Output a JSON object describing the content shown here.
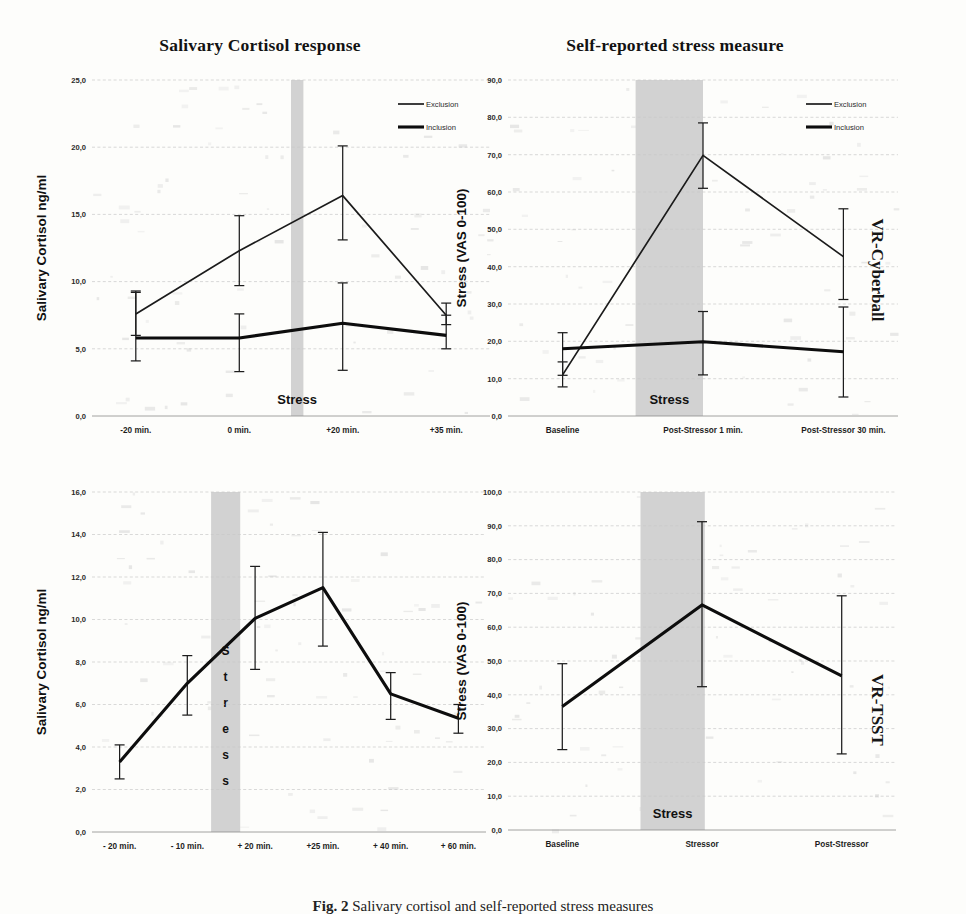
{
  "figure": {
    "caption_label": "Fig. 2",
    "caption_text": "Salivary cortisol and self-reported stress measures",
    "column_titles": [
      "Salivary  Cortisol response",
      "Self-reported stress measure"
    ],
    "row_labels": [
      "VR-Cyberball",
      "VR-TSST"
    ],
    "legend": [
      {
        "label": "Exclusion",
        "style": "thin"
      },
      {
        "label": "Inclusion",
        "style": "thick"
      }
    ],
    "band_label": "Stress",
    "colors": {
      "line": "#1b1b1b",
      "band": "#d2d2d2",
      "grid": "#c9c9c9",
      "text": "#1a1a1a"
    }
  },
  "chart_data": [
    {
      "id": "cyberball-cortisol",
      "type": "line",
      "title": "Salivary  Cortisol response",
      "row": "VR-Cyberball",
      "xlabel": "",
      "ylabel": "Salivary Cortisol ng/ml",
      "categories": [
        "-20 min.",
        "0 min.",
        "+20 min.",
        "+35 min."
      ],
      "ylim": [
        0,
        25
      ],
      "yticks": [
        "0,0",
        "5,0",
        "10,0",
        "15,0",
        "20,0",
        "25,0"
      ],
      "ytick_values": [
        0,
        5,
        10,
        15,
        20,
        25
      ],
      "grid": true,
      "legend_position": "top-right",
      "band": {
        "label": "Stress",
        "from_index": 1,
        "to_index": 2,
        "start_frac": 0.5,
        "end_frac": 0.62
      },
      "series": [
        {
          "name": "Exclusion",
          "style": "thin",
          "values": [
            7.6,
            12.3,
            16.4,
            7.5
          ],
          "err_low": [
            6.0,
            9.7,
            13.1,
            6.8
          ],
          "err_high": [
            9.3,
            14.9,
            20.1,
            8.4
          ]
        },
        {
          "name": "Inclusion",
          "style": "thick",
          "values": [
            5.8,
            5.8,
            6.9,
            6.0
          ],
          "err_low": [
            4.1,
            3.3,
            3.4,
            5.0
          ],
          "err_high": [
            9.2,
            7.6,
            9.9,
            7.5
          ]
        }
      ]
    },
    {
      "id": "cyberball-stress",
      "type": "line",
      "title": "Self-reported stress measure",
      "row": "VR-Cyberball",
      "xlabel": "",
      "ylabel": "Stress (VAS 0-100)",
      "categories": [
        "Baseline",
        "Post-Stressor 1 min.",
        "Post-Stressor 30 min."
      ],
      "ylim": [
        0,
        90
      ],
      "yticks": [
        "0,0",
        "10,0",
        "20,0",
        "30,0",
        "40,0",
        "50,0",
        "60,0",
        "70,0",
        "80,0",
        "90,0"
      ],
      "ytick_values": [
        0,
        10,
        20,
        30,
        40,
        50,
        60,
        70,
        80,
        90
      ],
      "grid": true,
      "legend_position": "top-right",
      "band": {
        "label": "Stress",
        "from_index": 0,
        "to_index": 1,
        "start_frac": 0.52,
        "end_frac": 1.0
      },
      "series": [
        {
          "name": "Exclusion",
          "style": "thin",
          "values": [
            11.0,
            69.8,
            42.7
          ],
          "err_low": [
            7.8,
            61.0,
            31.2
          ],
          "err_high": [
            14.5,
            78.5,
            55.5
          ]
        },
        {
          "name": "Inclusion",
          "style": "thick",
          "values": [
            18.0,
            19.9,
            17.2
          ],
          "err_low": [
            10.9,
            11.0,
            5.1
          ],
          "err_high": [
            22.3,
            28.0,
            29.2
          ]
        }
      ]
    },
    {
      "id": "tsst-cortisol",
      "type": "line",
      "title": "Salivary  Cortisol response",
      "row": "VR-TSST",
      "xlabel": "",
      "ylabel": "Salivary Cortisol ng/ml",
      "categories": [
        "- 20 min.",
        "- 10 min.",
        "+ 20 min.",
        "+25 min.",
        "+ 40 min.",
        "+ 60 min."
      ],
      "ylim": [
        0,
        16
      ],
      "yticks": [
        "0,0",
        "2,0",
        "4,0",
        "6,0",
        "8,0",
        "10,0",
        "12,0",
        "14,0",
        "16,0"
      ],
      "ytick_values": [
        0,
        2,
        4,
        6,
        8,
        10,
        12,
        14,
        16
      ],
      "grid": true,
      "legend_position": "none",
      "band": {
        "label": "Stress",
        "orientation": "vertical",
        "from_index": 1,
        "to_index": 2,
        "start_frac": 0.35,
        "end_frac": 0.78
      },
      "series": [
        {
          "name": "Cortisol",
          "style": "thick",
          "values": [
            3.3,
            7.0,
            10.05,
            11.5,
            6.5,
            5.35
          ],
          "err_low": [
            2.5,
            5.5,
            7.65,
            8.75,
            5.3,
            4.65
          ],
          "err_high": [
            4.1,
            8.3,
            12.5,
            14.1,
            7.5,
            6.0
          ]
        }
      ]
    },
    {
      "id": "tsst-stress",
      "type": "line",
      "title": "Self-reported stress measure",
      "row": "VR-TSST",
      "xlabel": "",
      "ylabel": "Stress (VAS 0-100)",
      "categories": [
        "Baseline",
        "Stressor",
        "Post-Stressor"
      ],
      "ylim": [
        0,
        100
      ],
      "yticks": [
        "0,0",
        "10,0",
        "20,0",
        "30,0",
        "40,0",
        "50,0",
        "60,0",
        "70,0",
        "80,0",
        "90,0",
        "100,0"
      ],
      "ytick_values": [
        0,
        10,
        20,
        30,
        40,
        50,
        60,
        70,
        80,
        90,
        100
      ],
      "grid": true,
      "legend_position": "none",
      "band": {
        "label": "Stress",
        "from_index": 0,
        "to_index": 1,
        "start_frac": 0.56,
        "end_frac": 1.02
      },
      "series": [
        {
          "name": "Stress",
          "style": "thick",
          "values": [
            36.5,
            66.6,
            45.6
          ],
          "err_low": [
            23.8,
            42.4,
            22.5
          ],
          "err_high": [
            49.2,
            91.2,
            69.3
          ]
        }
      ]
    }
  ]
}
